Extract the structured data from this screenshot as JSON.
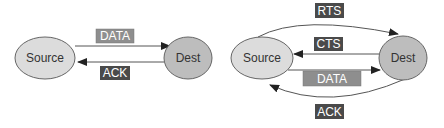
{
  "colors": {
    "node_fill_source": "#dcdcdc",
    "node_fill_dest": "#bdbdbd",
    "node_stroke": "#555555",
    "line": "#444444",
    "box_light": "#8e8e8e",
    "box_dark": "#4a4a4a",
    "box_text": "#ffffff"
  },
  "left_diagram": {
    "source": "Source",
    "dest": "Dest",
    "data_label": "DATA",
    "ack_label": "ACK"
  },
  "right_diagram": {
    "source": "Source",
    "dest": "Dest",
    "rts_label": "RTS",
    "cts_label": "CTS",
    "data_label": "DATA",
    "ack_label": "ACK"
  }
}
